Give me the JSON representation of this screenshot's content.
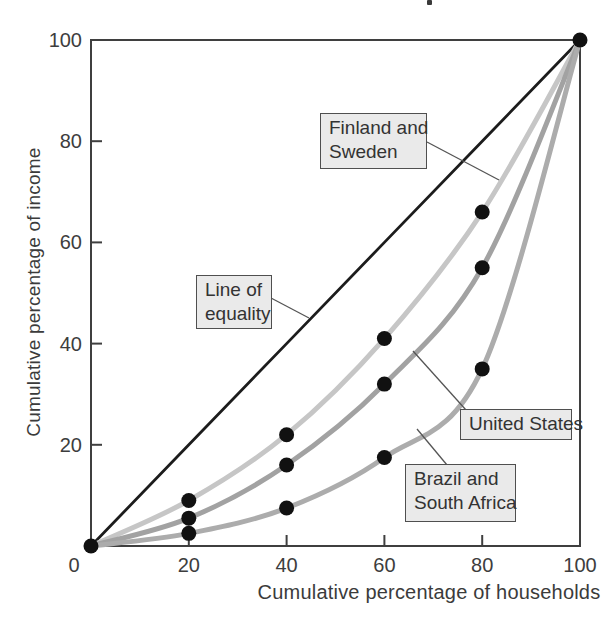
{
  "chart_data": {
    "type": "line",
    "title": "",
    "xlabel": "Cumulative percentage of households",
    "ylabel": "Cumulative percentage of income",
    "xlim": [
      0,
      100
    ],
    "ylim": [
      0,
      100
    ],
    "xticks": [
      0,
      20,
      40,
      60,
      80,
      100
    ],
    "yticks": [
      20,
      40,
      60,
      80,
      100
    ],
    "grid": false,
    "legend_position": "none (curves identified by callout boxes)",
    "x": [
      0,
      20,
      40,
      60,
      80,
      100
    ],
    "series": [
      {
        "name": "Line of equality",
        "values": [
          0,
          20,
          40,
          60,
          80,
          100
        ],
        "color": "#1c1c1c",
        "stroke_width": 2.8,
        "curve": "straight",
        "markers": [
          0,
          100
        ]
      },
      {
        "name": "Finland and Sweden",
        "values": [
          0,
          9,
          22,
          41,
          66,
          100
        ],
        "color": "#c6c6c6",
        "stroke_width": 5,
        "curve": "smooth",
        "markers": [
          20,
          40,
          60,
          80
        ]
      },
      {
        "name": "United States",
        "values": [
          0,
          5.5,
          16,
          32,
          55,
          100
        ],
        "color": "#a2a2a2",
        "stroke_width": 5,
        "curve": "smooth",
        "markers": [
          20,
          40,
          60,
          80
        ]
      },
      {
        "name": "Brazil and South Africa",
        "values": [
          0,
          2.5,
          7.5,
          17.5,
          35,
          100
        ],
        "color": "#acacac",
        "stroke_width": 5,
        "curve": "smooth",
        "markers": [
          20,
          40,
          60,
          80
        ]
      }
    ],
    "annotations": [
      {
        "id": "finland-sweden-label",
        "lines": [
          "Finland and",
          "Sweden"
        ],
        "points_to": "Finland and Sweden",
        "box": {
          "left": 320,
          "top": 113,
          "width": 107,
          "height": 56
        },
        "leader": {
          "x1": 427,
          "y1": 142,
          "x2": 499,
          "y2": 180
        }
      },
      {
        "id": "line-of-equality-label",
        "lines": [
          "Line of",
          "equality"
        ],
        "points_to": "Line of equality",
        "box": {
          "left": 196,
          "top": 275,
          "width": 76,
          "height": 54
        },
        "leader": {
          "x1": 271,
          "y1": 298,
          "x2": 309,
          "y2": 318
        }
      },
      {
        "id": "united-states-label",
        "lines": [
          "United States"
        ],
        "points_to": "United States",
        "box": {
          "left": 460,
          "top": 409,
          "width": 112,
          "height": 31
        },
        "leader": {
          "x1": 466,
          "y1": 410,
          "x2": 413,
          "y2": 351
        }
      },
      {
        "id": "brazil-south-africa-label",
        "lines": [
          "Brazil and",
          "South Africa"
        ],
        "points_to": "Brazil and South Africa",
        "box": {
          "left": 405,
          "top": 464,
          "width": 111,
          "height": 58
        },
        "leader": {
          "x1": 447,
          "y1": 465,
          "x2": 417,
          "y2": 429
        }
      }
    ]
  },
  "style": {
    "background": "#ffffff",
    "axis_color": "#3f3f3f",
    "axis_width": 2,
    "tick_length": 11,
    "tick_label_color": "#3d3d3d",
    "marker_color": "#111111",
    "marker_radius": 7.5,
    "leader_color": "#555555",
    "leader_width": 1.3,
    "plot": {
      "x0": 91,
      "y0": 546,
      "sx": 4.89,
      "sy": 5.06
    }
  }
}
